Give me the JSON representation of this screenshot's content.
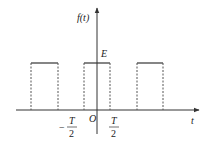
{
  "diagram": {
    "y_axis_label": "f(t)",
    "x_axis_label": "t",
    "amplitude_label": "E",
    "origin_label": "O",
    "tick_labels": {
      "neg_half_period": {
        "sign": "−",
        "numerator": "T",
        "denominator": "2"
      },
      "pos_half_period": {
        "numerator": "T",
        "denominator": "2"
      }
    },
    "pulses": [
      {
        "x_left": 31,
        "x_right": 58
      },
      {
        "x_left": 84,
        "x_right": 110
      },
      {
        "x_left": 137,
        "x_right": 163
      }
    ],
    "colors": {
      "line": "#333333",
      "dashed": "#555555"
    }
  }
}
